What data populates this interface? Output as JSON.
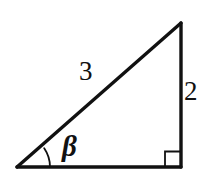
{
  "figure": {
    "kind": "right-triangle-diagram",
    "background_color": "#ffffff",
    "stroke_color": "#111111",
    "stroke_width": 3,
    "labels": {
      "hypotenuse": "3",
      "opposite_side": "2",
      "angle": "β"
    },
    "markers": {
      "right_angle": "right-angle-square",
      "angle_arc": "angle-arc"
    },
    "geometry": {
      "left_vertex": [
        17,
        167
      ],
      "top_right_vertex": [
        181,
        23
      ],
      "bottom_right_vertex": [
        181,
        167
      ],
      "base_length_px": 164,
      "height_px": 144,
      "angle_arc_radius_px": 33,
      "right_angle_square_px": 15
    }
  }
}
